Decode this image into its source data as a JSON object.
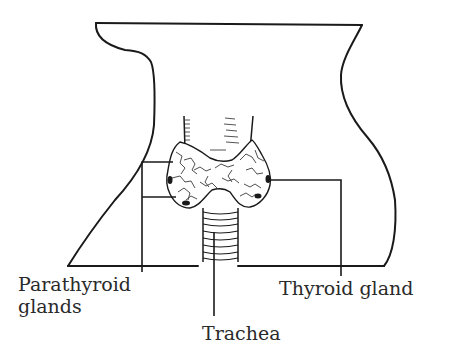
{
  "diagram": {
    "labels": {
      "parathyroid_line1": "Parathyroid",
      "parathyroid_line2": "glands",
      "thyroid": "Thyroid gland",
      "trachea": "Trachea"
    },
    "colors": {
      "stroke": "#1a1a1a",
      "background": "#ffffff",
      "text": "#2a2a2a"
    }
  }
}
